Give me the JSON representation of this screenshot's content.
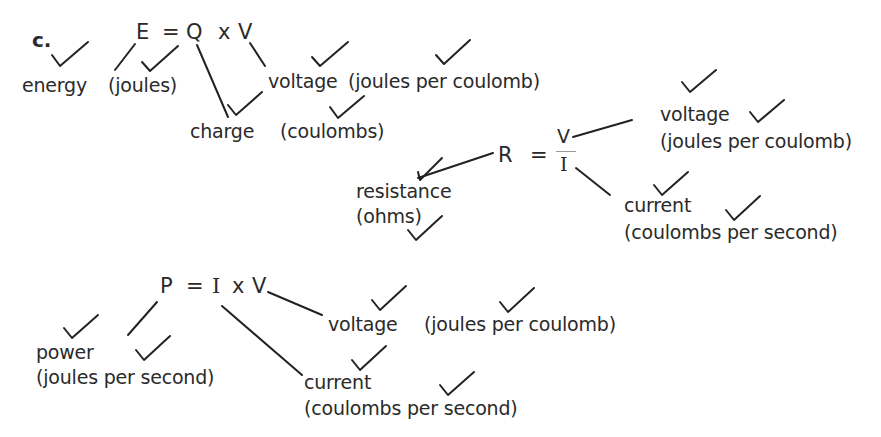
{
  "label": "c.",
  "eq1": {
    "parts": {
      "e": "E",
      "eq": "=",
      "q": "Q",
      "x": "x",
      "v": "V"
    },
    "terms": [
      {
        "name": "energy",
        "unit": "(joules)"
      },
      {
        "name": "charge",
        "unit": "(coulombs)"
      },
      {
        "name": "voltage",
        "unit": "(joules per coulomb)"
      }
    ]
  },
  "eq2": {
    "parts": {
      "r": "R",
      "eq": "=",
      "num": "V",
      "den": "I"
    },
    "terms": [
      {
        "name": "resistance",
        "unit": "(ohms)"
      },
      {
        "name": "voltage",
        "unit": "(joules per coulomb)"
      },
      {
        "name": "current",
        "unit": "(coulombs per second)"
      }
    ]
  },
  "eq3": {
    "parts": {
      "p": "P",
      "eq": "=",
      "i": "I",
      "x": "x",
      "v": "V"
    },
    "terms": [
      {
        "name": "power",
        "unit": "(joules per second)"
      },
      {
        "name": "voltage",
        "unit": "(joules per coulomb)"
      },
      {
        "name": "current",
        "unit": "(coulombs per second)"
      }
    ]
  },
  "marks": {
    "tick_count": 22,
    "tick_symbol": "check-mark"
  }
}
